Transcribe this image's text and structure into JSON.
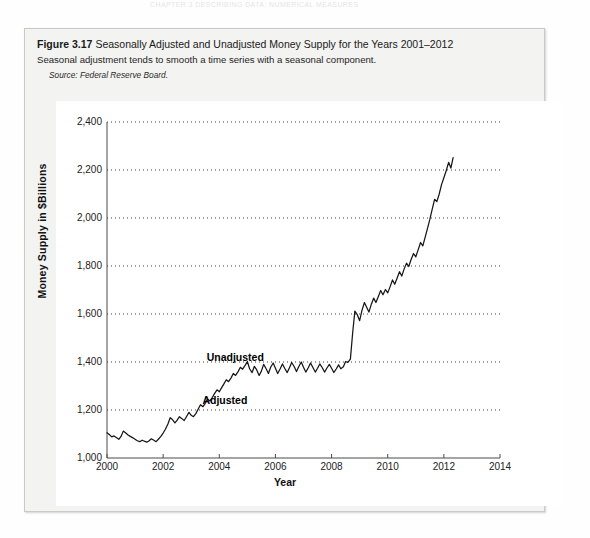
{
  "running_head": "CHAPTER 3  DESCRIBING DATA: NUMERICAL MEASURES",
  "figure": {
    "number": "Figure 3.17",
    "title": "Seasonally Adjusted and Unadjusted Money Supply for the Years 2001–2012",
    "subtitle": "Seasonal adjustment tends to smooth a time series with a seasonal component.",
    "source_label": "Source:",
    "source_text": "Federal Reserve Board."
  },
  "chart_data": {
    "type": "line",
    "title": "Seasonally Adjusted and Unadjusted Money Supply for the Years 2001–2012",
    "xlabel": "Year",
    "ylabel": "Money Supply in $Billions",
    "xlim": [
      2000,
      2014
    ],
    "ylim": [
      1000,
      2400
    ],
    "xticks": [
      2000,
      2002,
      2004,
      2006,
      2008,
      2010,
      2012,
      2014
    ],
    "xticklabels": [
      "2000",
      "2002",
      "2004",
      "2006",
      "2008",
      "2010",
      "2012",
      "2014"
    ],
    "yticks": [
      1000,
      1200,
      1400,
      1600,
      1800,
      2000,
      2200,
      2400
    ],
    "yticklabels": [
      "1,000",
      "1,200",
      "1,400",
      "1,600",
      "1,800",
      "2,000",
      "2,200",
      "2,400"
    ],
    "grid": "horizontal-dotted",
    "legend": "inline-annotations",
    "line_color": "#161616",
    "annotations": [
      {
        "text": "Unadjusted",
        "x": 2003.55,
        "y": 1418
      },
      {
        "text": "Adjusted",
        "x": 2003.4,
        "y": 1237
      }
    ],
    "series": [
      {
        "name": "Money Supply",
        "x": [
          2000.0,
          2000.08,
          2000.17,
          2000.25,
          2000.33,
          2000.42,
          2000.5,
          2000.58,
          2000.67,
          2000.75,
          2000.83,
          2000.92,
          2001.0,
          2001.08,
          2001.17,
          2001.25,
          2001.33,
          2001.42,
          2001.5,
          2001.58,
          2001.67,
          2001.75,
          2001.83,
          2001.92,
          2002.0,
          2002.08,
          2002.17,
          2002.25,
          2002.33,
          2002.42,
          2002.5,
          2002.58,
          2002.67,
          2002.75,
          2002.83,
          2002.92,
          2003.0,
          2003.08,
          2003.17,
          2003.25,
          2003.33,
          2003.42,
          2003.5,
          2003.58,
          2003.67,
          2003.75,
          2003.83,
          2003.92,
          2004.0,
          2004.08,
          2004.17,
          2004.25,
          2004.33,
          2004.42,
          2004.5,
          2004.58,
          2004.67,
          2004.75,
          2004.83,
          2004.92,
          2005.0,
          2005.08,
          2005.17,
          2005.25,
          2005.33,
          2005.42,
          2005.5,
          2005.58,
          2005.67,
          2005.75,
          2005.83,
          2005.92,
          2006.0,
          2006.08,
          2006.17,
          2006.25,
          2006.33,
          2006.42,
          2006.5,
          2006.58,
          2006.67,
          2006.75,
          2006.83,
          2006.92,
          2007.0,
          2007.08,
          2007.17,
          2007.25,
          2007.33,
          2007.42,
          2007.5,
          2007.58,
          2007.67,
          2007.75,
          2007.83,
          2007.92,
          2008.0,
          2008.08,
          2008.17,
          2008.25,
          2008.33,
          2008.42,
          2008.5,
          2008.58,
          2008.67,
          2008.75,
          2008.83,
          2008.92,
          2009.0,
          2009.08,
          2009.17,
          2009.25,
          2009.33,
          2009.42,
          2009.5,
          2009.58,
          2009.67,
          2009.75,
          2009.83,
          2009.92,
          2010.0,
          2010.08,
          2010.17,
          2010.25,
          2010.33,
          2010.42,
          2010.5,
          2010.58,
          2010.67,
          2010.75,
          2010.83,
          2010.92,
          2011.0,
          2011.08,
          2011.17,
          2011.25,
          2011.33,
          2011.42,
          2011.5,
          2011.58,
          2011.67,
          2011.75,
          2011.83,
          2011.92,
          2012.0,
          2012.08,
          2012.17,
          2012.25,
          2012.33
        ],
        "y": [
          1105,
          1098,
          1088,
          1092,
          1085,
          1078,
          1090,
          1112,
          1104,
          1096,
          1090,
          1084,
          1078,
          1072,
          1068,
          1074,
          1070,
          1066,
          1072,
          1080,
          1074,
          1068,
          1078,
          1090,
          1104,
          1120,
          1142,
          1168,
          1160,
          1146,
          1158,
          1172,
          1164,
          1156,
          1172,
          1190,
          1178,
          1172,
          1186,
          1204,
          1222,
          1214,
          1228,
          1246,
          1238,
          1252,
          1268,
          1284,
          1276,
          1292,
          1310,
          1326,
          1318,
          1334,
          1352,
          1344,
          1360,
          1378,
          1370,
          1386,
          1402,
          1372,
          1356,
          1382,
          1368,
          1344,
          1362,
          1390,
          1372,
          1352,
          1378,
          1396,
          1374,
          1352,
          1372,
          1392,
          1374,
          1356,
          1376,
          1398,
          1380,
          1360,
          1380,
          1400,
          1378,
          1358,
          1376,
          1396,
          1378,
          1358,
          1374,
          1392,
          1376,
          1358,
          1374,
          1390,
          1374,
          1356,
          1372,
          1388,
          1372,
          1380,
          1402,
          1398,
          1412,
          1520,
          1612,
          1596,
          1572,
          1614,
          1648,
          1628,
          1608,
          1642,
          1666,
          1648,
          1674,
          1698,
          1680,
          1702,
          1688,
          1712,
          1742,
          1724,
          1748,
          1776,
          1758,
          1786,
          1812,
          1798,
          1826,
          1852,
          1838,
          1866,
          1898,
          1884,
          1918,
          1958,
          1994,
          2034,
          2078,
          2068,
          2098,
          2140,
          2168,
          2196,
          2232,
          2208,
          2252
        ]
      }
    ]
  }
}
